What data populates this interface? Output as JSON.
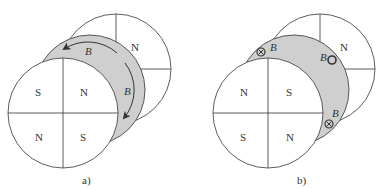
{
  "figures": [
    {
      "caption": "a)",
      "front_disc": {
        "quadrants": [
          "S",
          "N",
          "N",
          "S"
        ]
      },
      "back_disc": {
        "label": "N"
      },
      "flux_labels": [
        "B",
        "B"
      ],
      "arrows": "curved flux arrows pointing down-left and down along gray band"
    },
    {
      "caption": "b)",
      "front_disc": {
        "quadrants": [
          "N",
          "S",
          "S",
          "N"
        ]
      },
      "back_disc": {
        "label": "N"
      },
      "flux_labels": [
        "B",
        "B",
        "B"
      ],
      "flux_symbols": [
        "into-page",
        "out-of-page",
        "into-page"
      ]
    }
  ],
  "colors": {
    "band": "#cfcfcf",
    "stroke": "#333333",
    "fill": "#ffffff"
  }
}
